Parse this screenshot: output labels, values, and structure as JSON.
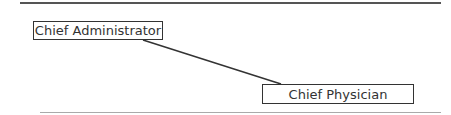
{
  "diagram": {
    "nodes": [
      {
        "id": "n1",
        "label": "Chief Administrator"
      },
      {
        "id": "n2",
        "label": "Chief Physician"
      }
    ],
    "edges": [
      {
        "from": "n1",
        "to": "n2"
      }
    ]
  }
}
